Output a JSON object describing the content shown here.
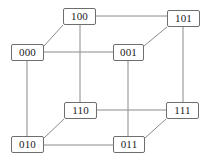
{
  "figure": {
    "name": "3-bit hypercube graph",
    "line_color": "#8a8a8a",
    "box_border_color": "#6e6e6e",
    "box_fill_color": "#ffffff",
    "text_color": "#1a1a1a",
    "background_color": "#ffffff",
    "width": 202,
    "height": 161
  },
  "nodes": [
    {
      "id": "n100",
      "label": "100",
      "x": 63,
      "y": 8,
      "w": 33,
      "h": 17
    },
    {
      "id": "n101",
      "label": "101",
      "x": 167,
      "y": 10,
      "w": 33,
      "h": 17
    },
    {
      "id": "n000",
      "label": "000",
      "x": 11,
      "y": 44,
      "w": 33,
      "h": 17
    },
    {
      "id": "n001",
      "label": "001",
      "x": 113,
      "y": 44,
      "w": 31,
      "h": 17
    },
    {
      "id": "n110",
      "label": "110",
      "x": 64,
      "y": 102,
      "w": 33,
      "h": 17
    },
    {
      "id": "n111",
      "label": "111",
      "x": 166,
      "y": 102,
      "w": 33,
      "h": 17
    },
    {
      "id": "n010",
      "label": "010",
      "x": 11,
      "y": 136,
      "w": 33,
      "h": 17
    },
    {
      "id": "n011",
      "label": "011",
      "x": 113,
      "y": 136,
      "w": 32,
      "h": 17
    }
  ],
  "edges": [
    {
      "id": "e-100-101",
      "from": "100",
      "to": "101",
      "kind": "horizontal",
      "x1": 96,
      "y1": 16,
      "x2": 167,
      "y2": 16
    },
    {
      "id": "e-000-001",
      "from": "000",
      "to": "001",
      "kind": "horizontal",
      "x1": 44,
      "y1": 52,
      "x2": 113,
      "y2": 52
    },
    {
      "id": "e-110-111",
      "from": "110",
      "to": "111",
      "kind": "horizontal",
      "x1": 97,
      "y1": 110,
      "x2": 166,
      "y2": 110
    },
    {
      "id": "e-010-011",
      "from": "010",
      "to": "011",
      "kind": "horizontal",
      "x1": 44,
      "y1": 145,
      "x2": 113,
      "y2": 145
    },
    {
      "id": "e-100-110",
      "from": "100",
      "to": "110",
      "kind": "vertical",
      "x1": 80,
      "y1": 25,
      "x2": 80,
      "y2": 102
    },
    {
      "id": "e-101-111",
      "from": "101",
      "to": "111",
      "kind": "vertical",
      "x1": 183,
      "y1": 27,
      "x2": 183,
      "y2": 102
    },
    {
      "id": "e-000-010",
      "from": "000",
      "to": "010",
      "kind": "vertical",
      "x1": 27,
      "y1": 61,
      "x2": 27,
      "y2": 136
    },
    {
      "id": "e-001-011",
      "from": "001",
      "to": "011",
      "kind": "vertical",
      "x1": 128,
      "y1": 61,
      "x2": 128,
      "y2": 136
    },
    {
      "id": "e-000-100",
      "from": "000",
      "to": "100",
      "kind": "diagonal",
      "x1": 44,
      "y1": 46,
      "x2": 63,
      "y2": 25
    },
    {
      "id": "e-001-101",
      "from": "001",
      "to": "101",
      "kind": "diagonal",
      "x1": 144,
      "y1": 46,
      "x2": 167,
      "y2": 27
    },
    {
      "id": "e-010-110",
      "from": "010",
      "to": "110",
      "kind": "diagonal",
      "x1": 44,
      "y1": 138,
      "x2": 64,
      "y2": 119
    },
    {
      "id": "e-011-111",
      "from": "011",
      "to": "111",
      "kind": "diagonal",
      "x1": 145,
      "y1": 138,
      "x2": 166,
      "y2": 119
    }
  ]
}
